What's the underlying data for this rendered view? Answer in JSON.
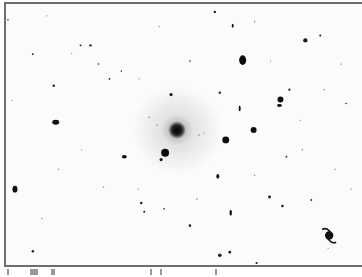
{
  "image": {
    "description": "Inverted (negative) astronomical field of a galaxy cluster",
    "background": "#fbfbfb",
    "ink": "#111111",
    "central_galaxy": {
      "x": 176,
      "y": 130,
      "r": 9,
      "halo_r": 45
    },
    "spiral_galaxy": {
      "x": 329,
      "y": 237,
      "r": 6
    },
    "galaxies": [
      {
        "x": 242,
        "y": 59,
        "rx": 3.5,
        "ry": 5
      },
      {
        "x": 164,
        "y": 153,
        "rx": 4,
        "ry": 4
      },
      {
        "x": 225,
        "y": 140,
        "rx": 3.5,
        "ry": 3.5
      },
      {
        "x": 54,
        "y": 122,
        "rx": 3.5,
        "ry": 2.5
      },
      {
        "x": 13,
        "y": 190,
        "rx": 2.5,
        "ry": 3.5
      },
      {
        "x": 280,
        "y": 99,
        "rx": 3,
        "ry": 3
      },
      {
        "x": 279,
        "y": 105,
        "rx": 2.5,
        "ry": 1.5
      },
      {
        "x": 253,
        "y": 130,
        "rx": 3,
        "ry": 3
      },
      {
        "x": 123,
        "y": 157,
        "rx": 2.5,
        "ry": 1.8
      },
      {
        "x": 217,
        "y": 177,
        "rx": 1.5,
        "ry": 2.5
      },
      {
        "x": 230,
        "y": 214,
        "rx": 1.2,
        "ry": 3
      },
      {
        "x": 239,
        "y": 108,
        "rx": 1,
        "ry": 3
      },
      {
        "x": 232,
        "y": 24,
        "rx": 1,
        "ry": 2
      }
    ],
    "stars": [
      {
        "x": 305,
        "y": 39,
        "r": 2.2
      },
      {
        "x": 170,
        "y": 94,
        "r": 1.6
      },
      {
        "x": 219,
        "y": 92,
        "r": 1.2
      },
      {
        "x": 214,
        "y": 10,
        "r": 1.2
      },
      {
        "x": 160,
        "y": 160,
        "r": 1.6
      },
      {
        "x": 269,
        "y": 198,
        "r": 1.5
      },
      {
        "x": 282,
        "y": 207,
        "r": 1.3
      },
      {
        "x": 89,
        "y": 44,
        "r": 1.2
      },
      {
        "x": 79,
        "y": 44,
        "r": 1
      },
      {
        "x": 52,
        "y": 85,
        "r": 1.2
      },
      {
        "x": 289,
        "y": 89,
        "r": 1.1
      },
      {
        "x": 320,
        "y": 34,
        "r": 1
      },
      {
        "x": 189,
        "y": 227,
        "r": 1.3
      },
      {
        "x": 219,
        "y": 257,
        "r": 1.8
      },
      {
        "x": 229,
        "y": 254,
        "r": 1.4
      },
      {
        "x": 140,
        "y": 204,
        "r": 1.2
      },
      {
        "x": 31,
        "y": 253,
        "r": 1.2
      },
      {
        "x": 256,
        "y": 265,
        "r": 1.1
      },
      {
        "x": 31,
        "y": 53,
        "r": 0.9
      },
      {
        "x": 108,
        "y": 78,
        "r": 0.9
      },
      {
        "x": 97,
        "y": 63,
        "r": 0.8
      },
      {
        "x": 143,
        "y": 213,
        "r": 1
      },
      {
        "x": 286,
        "y": 157,
        "r": 0.9
      },
      {
        "x": 311,
        "y": 201,
        "r": 0.9
      },
      {
        "x": 346,
        "y": 103,
        "r": 0.8
      },
      {
        "x": 189,
        "y": 60,
        "r": 0.8
      },
      {
        "x": 120,
        "y": 70,
        "r": 0.8
      },
      {
        "x": 163,
        "y": 210,
        "r": 0.8
      },
      {
        "x": 6,
        "y": 18,
        "r": 0.8
      },
      {
        "x": 324,
        "y": 89,
        "r": 0.7
      },
      {
        "x": 341,
        "y": 63,
        "r": 0.7
      },
      {
        "x": 254,
        "y": 20,
        "r": 0.7
      },
      {
        "x": 302,
        "y": 150,
        "r": 0.7
      },
      {
        "x": 196,
        "y": 200,
        "r": 0.7
      },
      {
        "x": 70,
        "y": 52,
        "r": 0.6
      },
      {
        "x": 138,
        "y": 78,
        "r": 0.6
      },
      {
        "x": 45,
        "y": 14,
        "r": 0.6
      },
      {
        "x": 57,
        "y": 170,
        "r": 0.6
      },
      {
        "x": 102,
        "y": 188,
        "r": 0.6
      },
      {
        "x": 254,
        "y": 176,
        "r": 0.6
      },
      {
        "x": 351,
        "y": 190,
        "r": 0.6
      },
      {
        "x": 10,
        "y": 100,
        "r": 0.6
      },
      {
        "x": 158,
        "y": 25,
        "r": 0.6
      },
      {
        "x": 198,
        "y": 135,
        "r": 0.7
      },
      {
        "x": 203,
        "y": 133,
        "r": 0.6
      },
      {
        "x": 148,
        "y": 117,
        "r": 0.7
      },
      {
        "x": 156,
        "y": 125,
        "r": 0.6
      },
      {
        "x": 137,
        "y": 190,
        "r": 0.6
      },
      {
        "x": 328,
        "y": 250,
        "r": 0.6
      },
      {
        "x": 80,
        "y": 150,
        "r": 0.6
      },
      {
        "x": 40,
        "y": 220,
        "r": 0.6
      },
      {
        "x": 270,
        "y": 60,
        "r": 0.6
      },
      {
        "x": 300,
        "y": 120,
        "r": 0.6
      },
      {
        "x": 335,
        "y": 170,
        "r": 0.6
      }
    ]
  },
  "bottom_strip": {
    "fragments": [
      {
        "x": 7,
        "w": 2
      },
      {
        "x": 30,
        "w": 8
      },
      {
        "x": 51,
        "w": 4
      },
      {
        "x": 150,
        "w": 2
      },
      {
        "x": 160,
        "w": 2
      },
      {
        "x": 215,
        "w": 2
      }
    ]
  }
}
